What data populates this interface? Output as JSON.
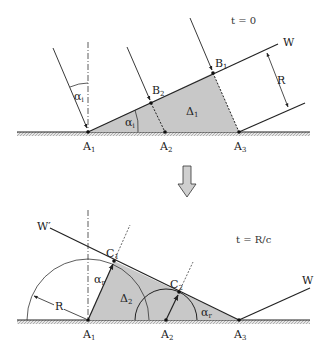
{
  "top_panel": {
    "time_label": "t = 0",
    "wavefront_label": "W",
    "dimension_label": "R",
    "angle_label_base": "α",
    "angle_label_sub": "i",
    "area_label_base": "Δ",
    "area_label_sub": "1",
    "points": [
      {
        "base": "A",
        "sub": "1"
      },
      {
        "base": "A",
        "sub": "2"
      },
      {
        "base": "A",
        "sub": "3"
      },
      {
        "base": "B",
        "sub": "1"
      },
      {
        "base": "B",
        "sub": "2"
      }
    ]
  },
  "bottom_panel": {
    "time_label": "t = R/c",
    "reflected_wavefront_label": "W′",
    "incident_wavefront_label": "W",
    "dimension_label": "R",
    "angle_label_base": "α",
    "angle_label_sub": "r",
    "area_label_base": "Δ",
    "area_label_sub": "2",
    "points": [
      {
        "base": "A",
        "sub": "1"
      },
      {
        "base": "A",
        "sub": "2"
      },
      {
        "base": "A",
        "sub": "3"
      },
      {
        "base": "C",
        "sub": "1"
      },
      {
        "base": "C",
        "sub": "2"
      }
    ]
  },
  "colors": {
    "shade": "#c8c8c8",
    "line": "#222222",
    "arrow_fill": "#cfcfcf"
  }
}
